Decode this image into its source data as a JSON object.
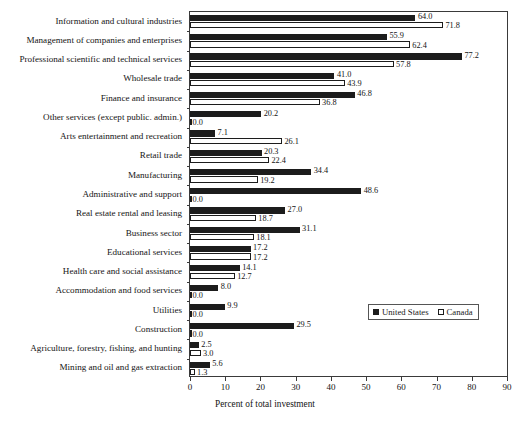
{
  "chart_data": {
    "type": "bar",
    "orientation": "horizontal",
    "title": "",
    "xlabel": "Percent of total investment",
    "ylabel": "",
    "xlim": [
      0,
      90
    ],
    "xticks": [
      0,
      10,
      20,
      30,
      40,
      50,
      60,
      70,
      80,
      90
    ],
    "grid": false,
    "legend_position": "center-right",
    "categories": [
      "Information and cultural industries",
      "Management of companies and enterprises",
      "Professional scientific and technical services",
      "Wholesale trade",
      "Finance and insurance",
      "Other services (except public. admin.)",
      "Arts entertainment and recreation",
      "Retail trade",
      "Manufacturing",
      "Administrative and support",
      "Real estate rental and leasing",
      "Business sector",
      "Educational services",
      "Health care and social assistance",
      "Accommodation and food services",
      "Utilities",
      "Construction",
      "Agriculture, forestry, fishing, and hunting",
      "Mining and oil and gas extraction"
    ],
    "series": [
      {
        "name": "United States",
        "color": "#1c1c1c",
        "values": [
          64.0,
          55.9,
          77.2,
          41.0,
          46.8,
          20.2,
          7.1,
          20.3,
          34.4,
          48.6,
          27.0,
          31.1,
          17.2,
          14.1,
          8.0,
          9.9,
          29.5,
          2.5,
          5.6
        ]
      },
      {
        "name": "Canada",
        "color": "#ffffff",
        "values": [
          71.8,
          62.4,
          57.8,
          43.9,
          36.8,
          0.0,
          26.1,
          22.4,
          19.2,
          0.0,
          18.7,
          18.1,
          17.2,
          12.7,
          0.0,
          0.0,
          0.0,
          3.0,
          1.3
        ]
      }
    ]
  },
  "legend": {
    "entries": [
      {
        "label": "United States",
        "swatch": "filled-square-icon"
      },
      {
        "label": "Canada",
        "swatch": "empty-square-icon"
      }
    ]
  },
  "axis": {
    "x_title": "Percent of total investment",
    "tick_labels": [
      "0",
      "10",
      "20",
      "30",
      "40",
      "50",
      "60",
      "70",
      "80",
      "90"
    ]
  },
  "value_labels": {
    "us": [
      "64.0",
      "55.9",
      "77.2",
      "41.0",
      "46.8",
      "20.2",
      "7.1",
      "20.3",
      "34.4",
      "48.6",
      "27.0",
      "31.1",
      "17.2",
      "14.1",
      "8.0",
      "9.9",
      "29.5",
      "2.5",
      "5.6"
    ],
    "ca": [
      "71.8",
      "62.4",
      "57.8",
      "43.9",
      "36.8",
      "0.0",
      "26.1",
      "22.4",
      "19.2",
      "0.0",
      "18.7",
      "18.1",
      "17.2",
      "12.7",
      "0.0",
      "0.0",
      "0.0",
      "3.0",
      "1.3"
    ]
  }
}
